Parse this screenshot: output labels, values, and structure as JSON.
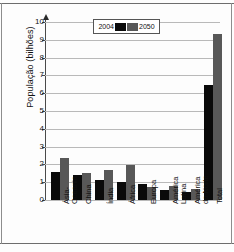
{
  "chart_data": {
    "type": "bar",
    "title": "",
    "xlabel": "",
    "ylabel": "População (bilhões)",
    "ylim": [
      0,
      10
    ],
    "ytick_step": 1,
    "grid": true,
    "legend_position": "top-center",
    "categories": [
      "Ásia-Oceania",
      "China",
      "Índia",
      "África",
      "Europa",
      "América Latina",
      "América do Norte",
      "Total"
    ],
    "category_lines": [
      [
        "Ásia-",
        "Oceania"
      ],
      [
        "China",
        ""
      ],
      [
        "Índia",
        ""
      ],
      [
        "África",
        ""
      ],
      [
        "Europa",
        ""
      ],
      [
        "América",
        "Latina"
      ],
      [
        "América",
        "do Norte"
      ],
      [
        "Total",
        ""
      ]
    ],
    "yticks": [
      "0",
      "1",
      "2",
      "3",
      "4",
      "5",
      "6",
      "7",
      "8",
      "9",
      "10"
    ],
    "series": [
      {
        "name": "2004",
        "color": "#0a0a0a",
        "values": [
          1.55,
          1.4,
          1.15,
          1.0,
          0.88,
          0.58,
          0.45,
          6.45
        ]
      },
      {
        "name": "2050",
        "color": "#585858",
        "values": [
          2.35,
          1.5,
          1.7,
          1.95,
          0.72,
          0.78,
          0.6,
          9.3
        ]
      }
    ]
  },
  "legend": {
    "left_label": "2004",
    "right_label": "2050",
    "swatch_left": "black-swatch",
    "swatch_right": "gray-swatch"
  },
  "axis": {
    "y_title": "População (bilhões)"
  }
}
